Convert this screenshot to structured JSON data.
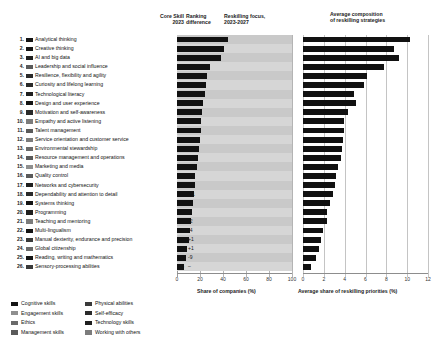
{
  "header": {
    "core_skill": "Core Skill\n2023",
    "core_skill_l1": "Core Skill",
    "core_skill_l2": "2023",
    "ranking_diff_l1": "Ranking",
    "ranking_diff_l2": "difference",
    "reskilling_focus_l1": "Reskilling focus,",
    "reskilling_focus_l2": "2023-2027",
    "avg_comp_l1": "Average composition",
    "avg_comp_l2": "of reskilling strategies"
  },
  "axes": {
    "middle": {
      "label": "Share of companies (%)",
      "ticks": [
        "0",
        "20",
        "40",
        "60",
        "80",
        "100"
      ],
      "min": 0,
      "max": 100
    },
    "right": {
      "label": "Average share of reskilling priorities (%)",
      "ticks": [
        "0",
        "2",
        "4",
        "6",
        "8",
        "10",
        "12"
      ],
      "min": 0,
      "max": 12
    }
  },
  "legend": {
    "left": [
      {
        "label": "Cognitive skills",
        "color": "#141414"
      },
      {
        "label": "Engagement skills",
        "color": "#8f8f8f"
      },
      {
        "label": "Ethics",
        "color": "#6a6a6a"
      },
      {
        "label": "Management skills",
        "color": "#5a5a5a"
      }
    ],
    "right": [
      {
        "label": "Physical abilities",
        "color": "#3a3a3a"
      },
      {
        "label": "Self-efficacy",
        "color": "#2a2a2a"
      },
      {
        "label": "Technology skills",
        "color": "#1f1f1f"
      },
      {
        "label": "Working with others",
        "color": "#7c7c7c"
      }
    ]
  },
  "chart_data": {
    "type": "bar",
    "orientation": "horizontal",
    "categories": [
      "Analytical thinking",
      "Creative thinking",
      "AI and big data",
      "Leadership and social influence",
      "Resilience, flexibility and agility",
      "Curiosity and lifelong learning",
      "Technological literacy",
      "Design and user experience",
      "Motivation and self-awareness",
      "Empathy and active listening",
      "Talent management",
      "Service orientation and customer service",
      "Environmental stewardship",
      "Resource management and operations",
      "Marketing and media",
      "Quality control",
      "Networks and cybersecurity",
      "Dependability and attention to detail",
      "Systems thinking",
      "Programming",
      "Teaching and mentoring",
      "Multi-lingualism",
      "Manual dexterity, endurance and precision",
      "Global citizenship",
      "Reading, writing and mathematics",
      "Sensory-processing abilities"
    ],
    "index": [
      "1.",
      "2.",
      "3.",
      "4.",
      "5.",
      "6.",
      "7.",
      "8.",
      "9.",
      "10.",
      "11.",
      "12.",
      "13.",
      "14.",
      "15.",
      "16.",
      "17.",
      "18.",
      "19.",
      "20.",
      "21.",
      "22.",
      "23.",
      "24.",
      "25.",
      "26."
    ],
    "core_skill_2023": [
      "1",
      "2",
      "15",
      "9",
      "3",
      "6",
      "6",
      "17",
      "4",
      "8",
      "12",
      "13",
      "23",
      "14",
      "21",
      "10",
      "22",
      "7",
      "11",
      "20",
      "19",
      "18",
      "24",
      "25",
      "16",
      "26"
    ],
    "ranking_difference": [
      "–",
      "–",
      "+12",
      "+5",
      "-2",
      "-1",
      "-1",
      "+9",
      "-5",
      "-2",
      "+1",
      "+1",
      "+10",
      "–",
      "+6",
      "-6",
      "+5",
      "-11",
      "-8",
      "–",
      "-2",
      "-4",
      "+1",
      "+1",
      "-9",
      "–"
    ],
    "swatch_colors": [
      "#141414",
      "#141414",
      "#1f1f1f",
      "#5a5a5a",
      "#2a2a2a",
      "#2a2a2a",
      "#1f1f1f",
      "#141414",
      "#2a2a2a",
      "#7c7c7c",
      "#5a5a5a",
      "#7c7c7c",
      "#6a6a6a",
      "#5a5a5a",
      "#8f8f8f",
      "#5a5a5a",
      "#1f1f1f",
      "#2a2a2a",
      "#141414",
      "#1f1f1f",
      "#7c7c7c",
      "#141414",
      "#3a3a3a",
      "#6a6a6a",
      "#141414",
      "#3a3a3a"
    ],
    "series": [
      {
        "name": "Share of companies (%)",
        "xlabel": "Share of companies (%)",
        "max": 100,
        "values": [
          44,
          41,
          38,
          29,
          26,
          25,
          24,
          23,
          22,
          21,
          21,
          20,
          19,
          18,
          17,
          16,
          16,
          15,
          14,
          13,
          12,
          11,
          10,
          9,
          8,
          6
        ]
      },
      {
        "name": "Average share of reskilling priorities (%)",
        "xlabel": "Average share of reskilling priorities (%)",
        "max": 12,
        "values": [
          10.3,
          8.7,
          9.2,
          7.8,
          6.1,
          5.9,
          4.9,
          5.1,
          4.3,
          3.9,
          3.9,
          3.8,
          3.7,
          3.6,
          3.4,
          3.2,
          3.1,
          2.9,
          2.6,
          2.3,
          2.3,
          1.9,
          1.7,
          1.5,
          1.2,
          0.8
        ]
      }
    ]
  }
}
